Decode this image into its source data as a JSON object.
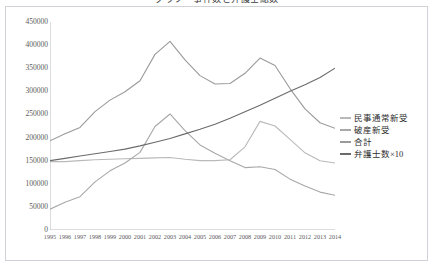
{
  "chart_data": {
    "type": "line",
    "title": "グラフ　事件数と弁護士総数",
    "xlabel": "",
    "ylabel": "",
    "x": [
      1995,
      1996,
      1997,
      1998,
      1999,
      2000,
      2001,
      2002,
      2003,
      2004,
      2005,
      2006,
      2007,
      2008,
      2009,
      2010,
      2011,
      2012,
      2013,
      2014
    ],
    "xtick_labels": [
      "1995",
      "1996",
      "1997",
      "1998",
      "1999",
      "2000",
      "2001",
      "2002",
      "2003",
      "2004",
      "2005",
      "2006",
      "2007",
      "2008",
      "2009",
      "2010",
      "2011",
      "2012",
      "2013",
      "2014"
    ],
    "ylim": [
      0,
      450000
    ],
    "ytick_values": [
      0,
      50000,
      100000,
      150000,
      200000,
      250000,
      300000,
      350000,
      400000,
      450000
    ],
    "ytick_labels": [
      "0",
      "50000",
      "100000",
      "150000",
      "200000",
      "250000",
      "300000",
      "350000",
      "400000",
      "450000"
    ],
    "grid": false,
    "legend_position": "right",
    "series": [
      {
        "name": "民事通常新受",
        "color": "#b9b9b9",
        "values": [
          148000,
          148000,
          150000,
          152000,
          153000,
          154000,
          155000,
          156000,
          157000,
          153000,
          150000,
          150000,
          152000,
          180000,
          235000,
          225000,
          196000,
          167000,
          150000,
          145000
        ]
      },
      {
        "name": "破産新受",
        "color": "#a8a8a8",
        "values": [
          45000,
          60000,
          72000,
          104000,
          128000,
          145000,
          168000,
          224000,
          251000,
          215000,
          184000,
          166000,
          150000,
          135000,
          137000,
          131000,
          110000,
          95000,
          82000,
          75000
        ]
      },
      {
        "name": "合計",
        "color": "#9a9a9a",
        "values": [
          193000,
          208000,
          222000,
          256000,
          281000,
          299000,
          323000,
          380000,
          408000,
          368000,
          334000,
          316000,
          317000,
          339000,
          372000,
          356000,
          306000,
          262000,
          232000,
          220000
        ]
      },
      {
        "name": "弁護士数×10",
        "color": "#6b6b6b",
        "values": [
          150000,
          155000,
          160000,
          165000,
          170000,
          175000,
          182000,
          190000,
          198000,
          208000,
          218000,
          229000,
          242000,
          256000,
          270000,
          285000,
          300000,
          314000,
          330000,
          350000
        ]
      }
    ]
  },
  "legend": {
    "items": [
      {
        "label": "民事通常新受"
      },
      {
        "label": "破産新受"
      },
      {
        "label": "合計"
      },
      {
        "label": "弁護士数×10"
      }
    ]
  },
  "colors": {
    "frame": "#cfd3d8",
    "axis": "#a8a8a8",
    "tick_text": "#5a5a5a",
    "background": "#ffffff"
  }
}
